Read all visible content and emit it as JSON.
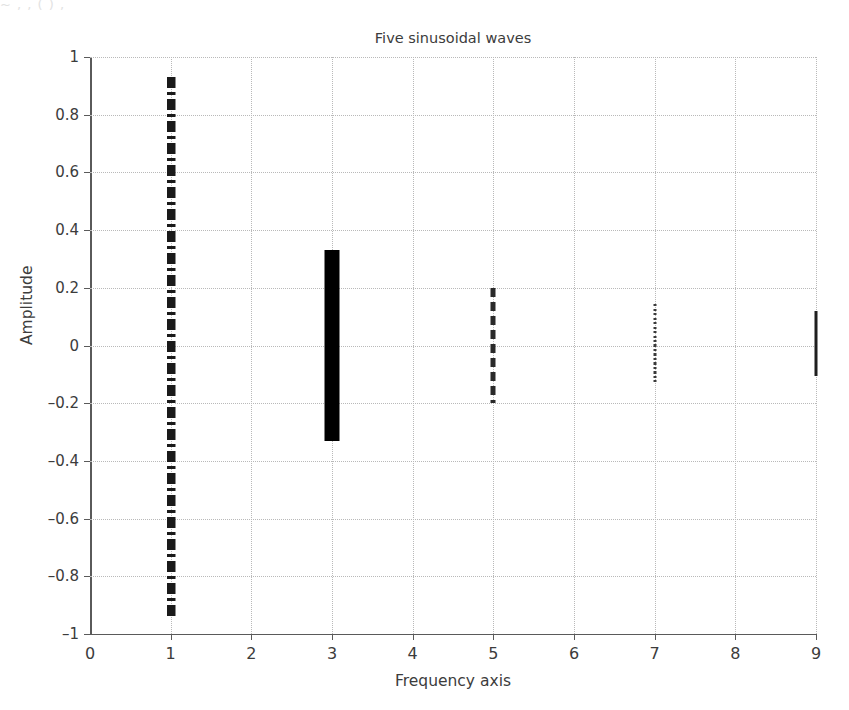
{
  "figure": {
    "crop_artifact_text": "~ , , ( ) ,"
  },
  "chart_data": {
    "type": "bar",
    "title": "Five sinusoidal waves",
    "xlabel": "Frequency axis",
    "ylabel": "Amplitude",
    "xlim": [
      0,
      9
    ],
    "ylim": [
      -1,
      1
    ],
    "grid": true,
    "legend": null,
    "xticks": [
      "0",
      "1",
      "2",
      "3",
      "4",
      "5",
      "6",
      "7",
      "8",
      "9"
    ],
    "xtick_values": [
      0,
      1,
      2,
      3,
      4,
      5,
      6,
      7,
      8,
      9
    ],
    "yticks": [
      "1",
      "0.8",
      "0.6",
      "0.4",
      "0.2",
      "0",
      "-0.2",
      "-0.4",
      "-0.6",
      "-0.8",
      "-1"
    ],
    "ytick_values": [
      1,
      0.8,
      0.6,
      0.4,
      0.2,
      0,
      -0.2,
      -0.4,
      -0.6,
      -0.8,
      -1
    ],
    "x": [
      1,
      3,
      5,
      7,
      9
    ],
    "values": [
      0.93,
      0.33,
      0.2,
      0.14,
      0.12
    ],
    "series": [
      {
        "name": "wave-1",
        "frequency": 1,
        "amplitude_top": 0.93,
        "amplitude_bottom": -0.95,
        "style": "dash-dot-thick",
        "width_px": 9,
        "color": "#1a1a1a"
      },
      {
        "name": "wave-3",
        "frequency": 3,
        "amplitude_top": 0.33,
        "amplitude_bottom": -0.33,
        "style": "solid-thick",
        "width_px": 15,
        "color": "#000000"
      },
      {
        "name": "wave-5",
        "frequency": 5,
        "amplitude_top": 0.2,
        "amplitude_bottom": -0.2,
        "style": "dashed",
        "width_px": 5,
        "color": "#2a2a2a"
      },
      {
        "name": "wave-7",
        "frequency": 7,
        "amplitude_top": 0.145,
        "amplitude_bottom": -0.135,
        "style": "dotted-fine",
        "width_px": 3,
        "color": "#3a3a3a"
      },
      {
        "name": "wave-9",
        "frequency": 9,
        "amplitude_top": 0.12,
        "amplitude_bottom": -0.105,
        "style": "solid-thin",
        "width_px": 3,
        "color": "#1f1f1f"
      }
    ]
  },
  "colors": {
    "axis": "#5a5a5a",
    "grid": "#b9b9b9",
    "text": "#3c3c3c",
    "background": "#ffffff"
  }
}
